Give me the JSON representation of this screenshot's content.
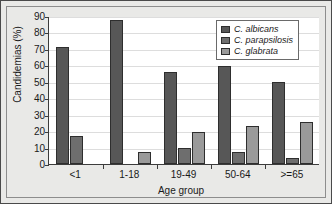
{
  "chart_data": {
    "type": "bar",
    "title": "",
    "xlabel": "Age group",
    "ylabel": "Candidemias (%)",
    "categories": [
      "<1",
      "1-18",
      "19-49",
      "50-64",
      ">=65"
    ],
    "series": [
      {
        "name": "C. albicans",
        "values": [
          71,
          87.5,
          56,
          59.5,
          50
        ],
        "color": "#575757"
      },
      {
        "name": "C. parapsilosis",
        "values": [
          17,
          0,
          9.5,
          7.5,
          3.5
        ],
        "color": "#6e6e6e"
      },
      {
        "name": "C. glabrata",
        "values": [
          0,
          7.5,
          19.5,
          23,
          25.5
        ],
        "color": "#9a9a9a"
      }
    ],
    "ylim": [
      0,
      90
    ],
    "yticks": [
      0,
      10,
      20,
      30,
      40,
      50,
      60,
      70,
      80,
      90
    ],
    "grid": true,
    "legend_position": "top-right"
  },
  "legend": {
    "items": [
      {
        "label": "C. albicans"
      },
      {
        "label": "C. parapsilosis"
      },
      {
        "label": "C. glabrata"
      }
    ]
  },
  "axes": {
    "y_title": "Candidemias (%)",
    "x_title": "Age group",
    "y_tick_labels": [
      "90",
      "80",
      "70",
      "60",
      "50",
      "40",
      "30",
      "20",
      "10",
      "0"
    ],
    "x_tick_labels": [
      "<1",
      "1-18",
      "19-49",
      "50-64",
      ">=65"
    ]
  },
  "colors": {
    "figure_background": "#e9e9e7",
    "plot_background": "#ffffff",
    "axis": "#3c3c3c",
    "grid": "#dddddd",
    "border": "#4a4a4a"
  }
}
